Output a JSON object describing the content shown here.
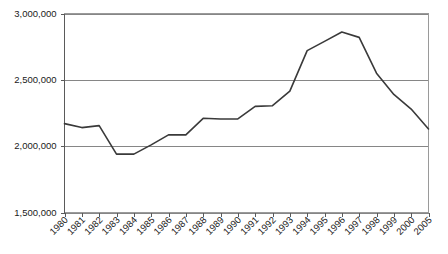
{
  "chart_data": {
    "type": "line",
    "title": "",
    "subtitle": "",
    "xlabel": "",
    "ylabel": "",
    "legend": [],
    "legend_position": "none",
    "grid": true,
    "grid_axis": "y",
    "ylim": [
      1500000,
      3000000
    ],
    "ytick_labels": [
      "3,000,000",
      "2,500,000",
      "2,000,000",
      "1,500,000"
    ],
    "ytick_values": [
      3000000,
      2500000,
      2000000,
      1500000
    ],
    "categories": [
      "1980",
      "1981",
      "1982",
      "1983",
      "1984",
      "1985",
      "1986",
      "1987",
      "1988",
      "1989",
      "1990",
      "1991",
      "1992",
      "1993",
      "1994",
      "1995",
      "1996",
      "1997",
      "1998",
      "1999",
      "2000",
      "2005"
    ],
    "values": [
      2170000,
      2140000,
      2155000,
      1940000,
      1940000,
      2010000,
      2085000,
      2085000,
      2210000,
      2205000,
      2205000,
      2300000,
      2305000,
      2415000,
      2720000,
      2790000,
      2860000,
      2820000,
      2550000,
      2390000,
      2280000,
      2130000
    ],
    "series": [
      {
        "name": "series-1",
        "color": "#3a3a3a",
        "values": [
          2170000,
          2140000,
          2155000,
          1940000,
          1940000,
          2010000,
          2085000,
          2085000,
          2210000,
          2205000,
          2205000,
          2300000,
          2305000,
          2415000,
          2720000,
          2790000,
          2860000,
          2820000,
          2550000,
          2390000,
          2280000,
          2130000
        ]
      }
    ],
    "annotations": []
  },
  "style": {
    "line_color": "#3a3a3a",
    "grid_color": "#868686",
    "axis_color": "#5a5a5a",
    "border_color": "#9a9a9a",
    "text_color": "#1a1a1a",
    "background": "#ffffff"
  }
}
